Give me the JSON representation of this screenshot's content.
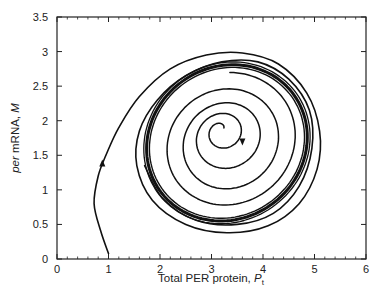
{
  "chart_data": {
    "type": "line",
    "title": "",
    "xlabel": "Total PER protein, P_t",
    "xlabel_main": "Total PER protein, ",
    "xlabel_var": "P",
    "xlabel_sub": "t",
    "ylabel": "per mRNA, M",
    "ylabel_italic": "per",
    "ylabel_main": " mRNA, ",
    "ylabel_var": "M",
    "xlim": [
      0,
      6
    ],
    "ylim": [
      0,
      3.5
    ],
    "xticks": [
      0,
      1,
      2,
      3,
      4,
      5,
      6
    ],
    "xtick_labels": [
      "0",
      "1",
      "2",
      "3",
      "4",
      "5",
      "6"
    ],
    "yticks": [
      0,
      0.5,
      1,
      1.5,
      2,
      2.5,
      3,
      3.5
    ],
    "ytick_labels": [
      "0",
      "0.5",
      "1",
      "1.5",
      "2",
      "2.5",
      "3",
      "3.5"
    ],
    "minor_ticks_per_major_x": 5,
    "grid": false,
    "legend": null,
    "series": [
      {
        "name": "outer trajectory",
        "start": [
          1.0,
          0.08
        ],
        "points": [
          [
            1.0,
            0.08
          ],
          [
            0.85,
            0.4
          ],
          [
            0.72,
            0.8
          ],
          [
            0.8,
            1.2
          ],
          [
            0.95,
            1.5
          ],
          [
            1.2,
            1.9
          ],
          [
            1.6,
            2.35
          ],
          [
            2.2,
            2.75
          ],
          [
            2.9,
            2.95
          ],
          [
            3.6,
            2.98
          ],
          [
            4.3,
            2.82
          ],
          [
            4.85,
            2.4
          ],
          [
            5.1,
            1.85
          ],
          [
            5.05,
            1.3
          ],
          [
            4.7,
            0.8
          ],
          [
            4.1,
            0.48
          ],
          [
            3.3,
            0.38
          ],
          [
            2.5,
            0.5
          ],
          [
            1.85,
            0.85
          ],
          [
            1.55,
            1.35
          ],
          [
            1.6,
            1.85
          ],
          [
            1.95,
            2.3
          ],
          [
            2.5,
            2.65
          ],
          [
            3.2,
            2.85
          ],
          [
            3.9,
            2.85
          ],
          [
            4.5,
            2.6
          ],
          [
            4.9,
            2.15
          ],
          [
            4.95,
            1.6
          ],
          [
            4.7,
            1.05
          ],
          [
            4.2,
            0.66
          ],
          [
            3.5,
            0.5
          ],
          [
            2.7,
            0.56
          ],
          [
            2.05,
            0.88
          ],
          [
            1.7,
            1.35
          ]
        ]
      },
      {
        "name": "limit cycle",
        "center": [
          3.3,
          1.68
        ],
        "radius_x": 1.6,
        "radius_y": 1.1,
        "rotation_deg": -35
      },
      {
        "name": "inner trajectory",
        "start": [
          3.15,
          1.87
        ],
        "points": "spiral from focus outward to limit cycle"
      }
    ],
    "arrows": [
      {
        "at": [
          0.88,
          1.38
        ],
        "direction": "up"
      },
      {
        "at": [
          3.6,
          1.7
        ],
        "direction": "down"
      }
    ]
  }
}
